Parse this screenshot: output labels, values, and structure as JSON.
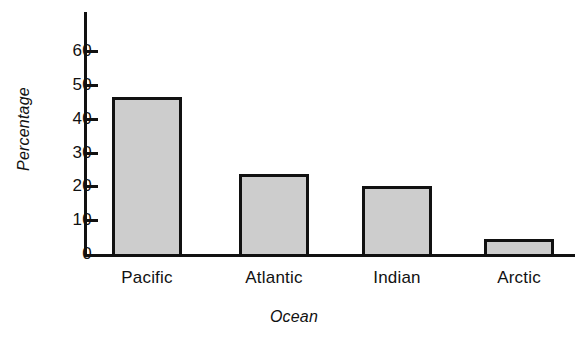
{
  "chart_data": {
    "type": "bar",
    "title": "",
    "xlabel": "Ocean",
    "ylabel": "Percentage",
    "categories": [
      "Pacific",
      "Atlantic",
      "Indian",
      "Arctic"
    ],
    "values": [
      46.5,
      23.5,
      20,
      4.5
    ],
    "ylim": [
      0,
      68
    ],
    "yticks": [
      0,
      10,
      20,
      30,
      40,
      50,
      60
    ],
    "ytick_labels": [
      "0",
      "10",
      "20",
      "30",
      "40",
      "50",
      "60"
    ],
    "grid": false,
    "legend": false,
    "bar_fill_color": "#cdcdcd",
    "bar_edge_color": "#111111",
    "axis_color": "#111111"
  },
  "axes": {
    "y_title": "Percentage",
    "x_title": "Ocean"
  },
  "ticks": [
    {
      "label": "60",
      "value": 60
    },
    {
      "label": "50",
      "value": 50
    },
    {
      "label": "40",
      "value": 40
    },
    {
      "label": "30",
      "value": 30
    },
    {
      "label": "20",
      "value": 20
    },
    {
      "label": "10",
      "value": 10
    },
    {
      "label": "0",
      "value": 0
    }
  ],
  "bars": [
    {
      "label": "Pacific",
      "value": 46.5
    },
    {
      "label": "Atlantic",
      "value": 23.5
    },
    {
      "label": "Indian",
      "value": 20
    },
    {
      "label": "Arctic",
      "value": 4.5
    }
  ]
}
